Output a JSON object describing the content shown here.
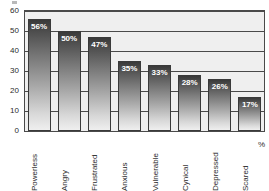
{
  "chart_data": {
    "type": "bar",
    "title": "",
    "subtitle": "",
    "xlabel": "",
    "ylabel": "%",
    "ylim": [
      0,
      60
    ],
    "yticks": [
      0,
      10,
      20,
      30,
      40,
      50,
      60
    ],
    "ytick_labels": [
      "0",
      "10",
      "20",
      "30",
      "40",
      "50",
      "60"
    ],
    "grid": "horizontal",
    "legend": "none",
    "categories": [
      "Powerless",
      "Angry",
      "Frustrated",
      "Anxious",
      "Vulnerable",
      "Cynical",
      "Depressed",
      "Scared"
    ],
    "values": [
      56,
      50,
      47,
      35,
      33,
      28,
      26,
      17
    ],
    "data_labels": [
      "56%",
      "50%",
      "47%",
      "35%",
      "33%",
      "28%",
      "26%",
      "17%"
    ],
    "colors": {
      "bar_gradient_top": "#3a3a3a",
      "bar_gradient_bottom": "#efefef",
      "bar_outline": "#3a3a3a",
      "plot_background": "#efefef",
      "gridline": "#4a4a4a",
      "axis_text": "#2b2b2b",
      "data_label_text": "#ffffff",
      "page_background": "#ffffff"
    }
  }
}
